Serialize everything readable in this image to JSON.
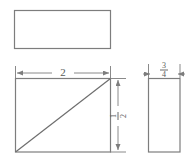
{
  "drawing": {
    "background_color": "#ffffff",
    "line_color": "#7d7d7d",
    "text_color": "#5a5a5a",
    "views": {
      "top_view": {
        "name": "top-view-rectangle",
        "x": 14,
        "y": 10,
        "width": 96,
        "height": 38
      },
      "front_view": {
        "name": "front-view-rectangle",
        "x": 15,
        "y": 78,
        "width": 95,
        "height": 74,
        "diagonal": {
          "name": "diagonal-line",
          "x1": 15,
          "y1": 152,
          "x2": 110,
          "y2": 78
        }
      },
      "side_view": {
        "name": "side-view-rectangle",
        "x": 148,
        "y": 78,
        "width": 32,
        "height": 74
      }
    },
    "dimensions": {
      "width_dimension": {
        "label": "2",
        "orientation": "horizontal",
        "line_y": 73,
        "x_start": 16,
        "x_end": 110,
        "label_x": 63,
        "label_y": 70
      },
      "height_dimension": {
        "numerator": "1",
        "denominator": "2",
        "orientation": "vertical",
        "line_x": 118,
        "y_start": 79,
        "y_end": 151,
        "label_x": 118,
        "label_y": 115
      },
      "depth_dimension": {
        "numerator": "3",
        "denominator": "4",
        "orientation": "horizontal",
        "line_y": 74,
        "x_start": 148,
        "x_end": 180,
        "label_x": 164,
        "label_y": 66
      }
    }
  }
}
